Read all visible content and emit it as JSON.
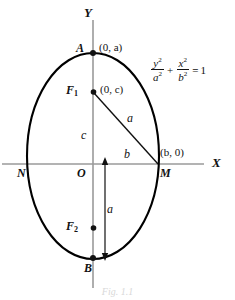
{
  "figure": {
    "kind": "geometry-diagram",
    "background_color": "#ffffff",
    "ink_color": "#111111",
    "axis_color": "#9a9a9a",
    "curve_color": "#000000",
    "caption": "Fig. 1.1"
  },
  "axes": {
    "x_label": "X",
    "y_label": "Y"
  },
  "equation": {
    "num1": "y",
    "den1": "a",
    "num2": "x",
    "den2": "b",
    "sup1": "2",
    "sup2": "2",
    "sup3": "2",
    "sup4": "2",
    "plus": "+",
    "equals": "=",
    "rhs": "1"
  },
  "points": [
    {
      "id": "A",
      "name": "A",
      "coord": "(0, a)",
      "coord_var": "a",
      "x": 93,
      "y": 53,
      "dot": true
    },
    {
      "id": "B",
      "name": "B",
      "coord": "",
      "coord_var": "",
      "x": 93,
      "y": 258,
      "dot": true
    },
    {
      "id": "F1",
      "name": "F",
      "sub": "1",
      "coord": "(0, c)",
      "coord_var": "c",
      "x": 93,
      "y": 92,
      "dot": true
    },
    {
      "id": "F2",
      "name": "F",
      "sub": "2",
      "coord": "",
      "coord_var": "",
      "x": 93,
      "y": 228,
      "dot": true
    },
    {
      "id": "M",
      "name": "M",
      "coord": "(b, 0)",
      "coord_var": "b",
      "x": 159,
      "y": 164,
      "dot": false
    },
    {
      "id": "N",
      "name": "N",
      "coord": "",
      "coord_var": "",
      "x": 28,
      "y": 164,
      "dot": false
    },
    {
      "id": "O",
      "name": "O",
      "coord": "",
      "coord_var": "",
      "x": 93,
      "y": 164,
      "dot": false
    }
  ],
  "labels": {
    "point_a": "A",
    "point_b": "B",
    "point_m": "M",
    "point_n": "N",
    "point_o": "O",
    "focus1": "F",
    "focus1_sub": "1",
    "focus2": "F",
    "focus2_sub": "2",
    "coord_a": "(0, a)",
    "coord_c": "(0, c)",
    "coord_m": "(b, 0)",
    "seg_a_hyp": "a",
    "seg_c": "c",
    "seg_b": "b",
    "seg_a_arrow": "a"
  },
  "geometry": {
    "center_x": 93,
    "center_y": 164,
    "semi_major_y": 105,
    "semi_minor_x": 66,
    "focus_offset": 72,
    "arrow_x": 105,
    "arrow_top_y": 160,
    "arrow_bottom_y": 258,
    "x_axis_y": 164,
    "x_axis_x1": 2,
    "x_axis_x2": 204,
    "y_axis_x": 93,
    "y_axis_y1": 20,
    "y_axis_y2": 288
  }
}
